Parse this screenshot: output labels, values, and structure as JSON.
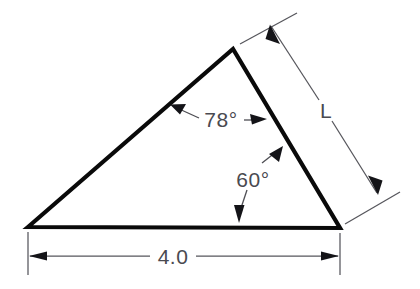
{
  "diagram": {
    "type": "engineering-dimension-drawing",
    "labels": {
      "angle_apex": "78°",
      "angle_base_right": "60°",
      "side_right": "L",
      "side_base": "4.0"
    },
    "values": {
      "angle_apex_degrees": 78,
      "angle_base_right_degrees": 60,
      "base_length": "4.0",
      "unknown_side": "L"
    },
    "colors": {
      "outline": "#0a0a0a",
      "dimension": "#56565c",
      "text": "#4a4a50",
      "background": "#ffffff"
    },
    "geometry": {
      "vertex_left": [
        28,
        227
      ],
      "vertex_right": [
        340,
        228
      ],
      "vertex_apex": [
        233,
        49
      ]
    }
  }
}
